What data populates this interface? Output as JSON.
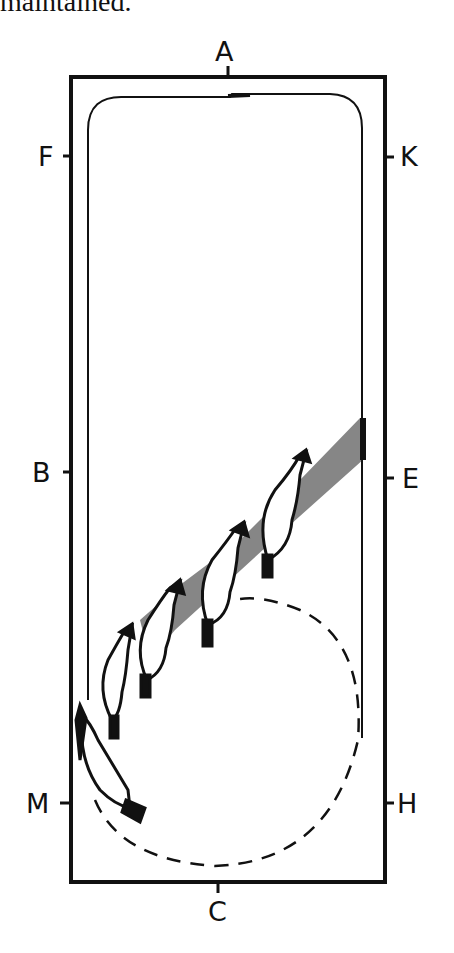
{
  "caption_fragment": "maintained.",
  "arena": {
    "markers": {
      "top": "A",
      "bottom": "C",
      "left_upper": "F",
      "left_middle": "B",
      "left_lower": "M",
      "right_upper": "K",
      "right_middle": "E",
      "right_lower": "H"
    }
  },
  "figure": {
    "horse_count": 5,
    "path_style": "solid track line, dashed circle"
  }
}
